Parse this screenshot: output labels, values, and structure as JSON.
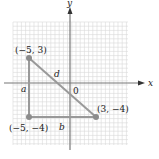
{
  "diagram": {
    "axes": {
      "x_label": "x",
      "y_label": "y",
      "origin_label": "0"
    },
    "grid": {
      "x_min": -6.5,
      "x_max": 7,
      "y_min": -7.5,
      "y_max": 7,
      "step": 0.5
    },
    "points": [
      {
        "id": "p1",
        "label": "(−5, 3)",
        "x": -5,
        "y": 3
      },
      {
        "id": "p2",
        "label": "(3, −4)",
        "x": 3,
        "y": -4
      },
      {
        "id": "p3",
        "label": "(−5, −4)",
        "x": -5,
        "y": -4
      }
    ],
    "segments": [
      {
        "label": "a",
        "from": "p1",
        "to": "p3"
      },
      {
        "label": "b",
        "from": "p3",
        "to": "p2"
      },
      {
        "label": "d",
        "from": "p1",
        "to": "p2"
      }
    ],
    "colors": {
      "grid": "#d8d8d8",
      "axis": "#777777",
      "triangle": "#999999",
      "point": "#8c8c8c"
    }
  }
}
